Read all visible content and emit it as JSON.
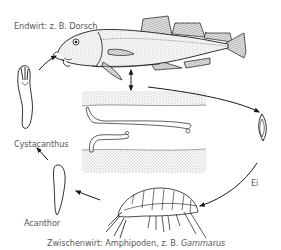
{
  "diagram": {
    "type": "life-cycle",
    "colors": {
      "line": "#1a1a1a",
      "text": "#5a5a5a",
      "stipple": "#bdbdbd",
      "background": "#ffffff"
    },
    "labels": {
      "final_host": "Endwirt: z. B. Dorsch",
      "egg": "Ei",
      "intermediate_host_prefix": "Zwischenwirt: Amphipoden, z. B. ",
      "intermediate_host_genus": "Gammarus",
      "acanthor": "Acanthor",
      "cystacanthus": "Cystacanthus"
    },
    "stages": [
      {
        "id": "cod",
        "name": "final-host-cod"
      },
      {
        "id": "intestine",
        "name": "adult-worms-in-intestine"
      },
      {
        "id": "egg",
        "name": "egg"
      },
      {
        "id": "amphipod",
        "name": "intermediate-host-amphipod"
      },
      {
        "id": "acanthor",
        "name": "acanthor-larva"
      },
      {
        "id": "cystacanthus",
        "name": "cystacanthus-larva"
      }
    ],
    "arrows": [
      {
        "from": "cod",
        "to": "intestine",
        "style": "double-headed"
      },
      {
        "from": "cod",
        "to": "egg"
      },
      {
        "from": "egg",
        "to": "amphipod"
      },
      {
        "from": "amphipod",
        "to": "acanthor"
      },
      {
        "from": "acanthor",
        "to": "cystacanthus"
      },
      {
        "from": "cystacanthus",
        "to": "cod"
      }
    ]
  }
}
